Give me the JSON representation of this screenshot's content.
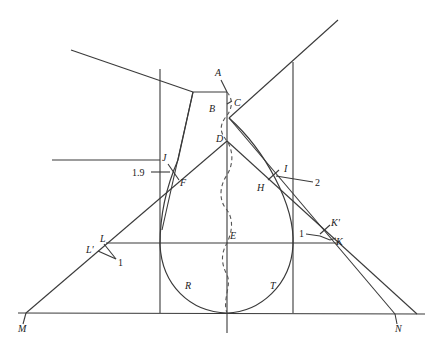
{
  "diagram": {
    "type": "geometric pattern drafting diagram (sleeve/armhole construction)",
    "point_labels": {
      "A": "A",
      "B": "B",
      "C": "C",
      "D": "D",
      "E": "E",
      "F": "F",
      "H": "H",
      "I": "I",
      "J": "J",
      "K": "K",
      "K_prime": "K'",
      "L": "L",
      "L_prime": "L'",
      "M": "M",
      "N": "N",
      "R": "R",
      "T": "T"
    },
    "measurements": {
      "left_offset": "1.9",
      "right_offset": "2",
      "k_offset": "1",
      "l_offset": "1"
    },
    "colors": {
      "line": "#3a3a3a",
      "background": "#ffffff"
    }
  }
}
